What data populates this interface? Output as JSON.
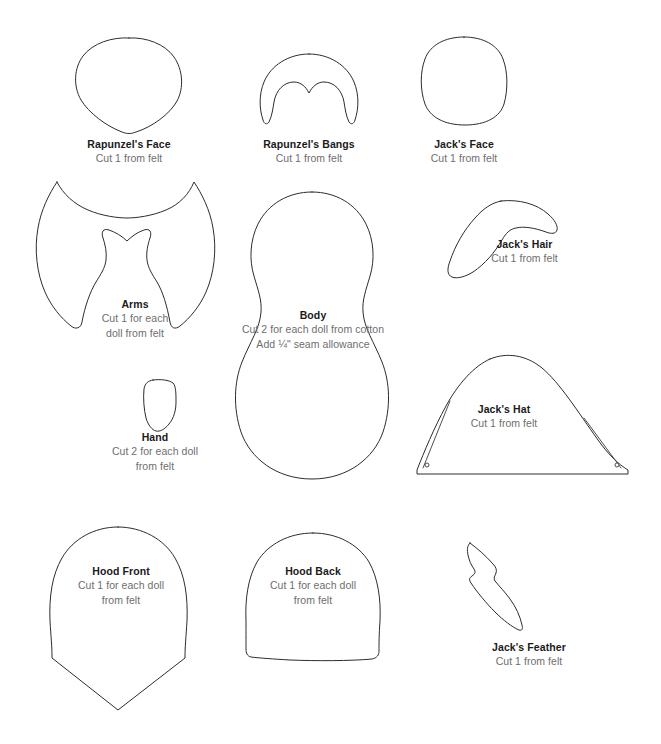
{
  "sheet": {
    "kind": "sewing-pattern-sheet",
    "background_color": "#ffffff",
    "outline_color": "#2c2c2c",
    "title_color": "#1a1a1a",
    "subtitle_color": "#6e6e6e"
  },
  "pieces": [
    {
      "id": "rapunzels-face",
      "title": "Rapunzel's Face",
      "lines": [
        "Cut 1 from felt"
      ]
    },
    {
      "id": "rapunzels-bangs",
      "title": "Rapunzel's Bangs",
      "lines": [
        "Cut 1 from felt"
      ]
    },
    {
      "id": "jacks-face",
      "title": "Jack's Face",
      "lines": [
        "Cut 1 from felt"
      ]
    },
    {
      "id": "arms",
      "title": "Arms",
      "lines": [
        "Cut 1 for each",
        "doll from felt"
      ]
    },
    {
      "id": "body",
      "title": "Body",
      "lines": [
        "Cut 2 for each doll from cotton",
        "Add ¼\" seam allowance"
      ]
    },
    {
      "id": "jacks-hair",
      "title": "Jack's Hair",
      "lines": [
        "Cut 1 from felt"
      ]
    },
    {
      "id": "hand",
      "title": "Hand",
      "lines": [
        "Cut 2 for each doll",
        "from felt"
      ]
    },
    {
      "id": "jacks-hat",
      "title": "Jack's Hat",
      "lines": [
        "Cut 1 from felt"
      ]
    },
    {
      "id": "hood-front",
      "title": "Hood Front",
      "lines": [
        "Cut 1 for each doll",
        "from felt"
      ]
    },
    {
      "id": "hood-back",
      "title": "Hood Back",
      "lines": [
        "Cut 1 for each doll",
        "from felt"
      ]
    },
    {
      "id": "jacks-feather",
      "title": "Jack's Feather",
      "lines": [
        "Cut 1 from felt"
      ]
    }
  ]
}
